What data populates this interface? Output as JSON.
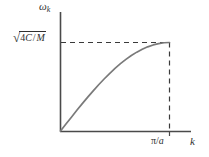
{
  "chart_data": {
    "type": "line",
    "title": "",
    "xlabel": "k",
    "ylabel": "ω",
    "ylabel_sub": "k",
    "y_tick_labels": [
      "√(4C / M)"
    ],
    "y_tick_parts": {
      "radical": "√",
      "numerator": "4",
      "numerator_sym": "C",
      "slash": "/",
      "denominator": "M"
    },
    "x_tick_labels": [
      "π/a"
    ],
    "x_tick_parts": {
      "pi": "π",
      "slash": "/",
      "a": "a"
    },
    "grid": false,
    "legend": "none",
    "axis_style": "two-spine-lshape",
    "guide_lines": [
      "horizontal-dashed-at-ymax",
      "vertical-dashed-at-xmax"
    ],
    "series": [
      {
        "name": "phonon dispersion",
        "formula": "omega_k = sqrt(4C/M) * sin(k*a/2)",
        "x": [
          0.0,
          0.05,
          0.1,
          0.15,
          0.2,
          0.25,
          0.3,
          0.35,
          0.4,
          0.45,
          0.5,
          0.55,
          0.6,
          0.65,
          0.7,
          0.75,
          0.8,
          0.85,
          0.9,
          0.95,
          1.0
        ],
        "y": [
          0.0,
          0.0785,
          0.1564,
          0.2334,
          0.309,
          0.3827,
          0.454,
          0.5225,
          0.5878,
          0.6494,
          0.7071,
          0.7604,
          0.809,
          0.8526,
          0.891,
          0.9239,
          0.9511,
          0.9724,
          0.9877,
          0.9969,
          1.0
        ]
      }
    ],
    "xlim": [
      0,
      1.15
    ],
    "ylim": [
      0,
      1.18
    ],
    "x_max_tick_value": 1.0,
    "y_max_tick_value": 1.0,
    "colors": {
      "axis": "#4a4a4a",
      "curve": "#7a7a7a",
      "dashed": "#3a3a3a",
      "text": "#303030",
      "background": "#ffffff"
    }
  }
}
